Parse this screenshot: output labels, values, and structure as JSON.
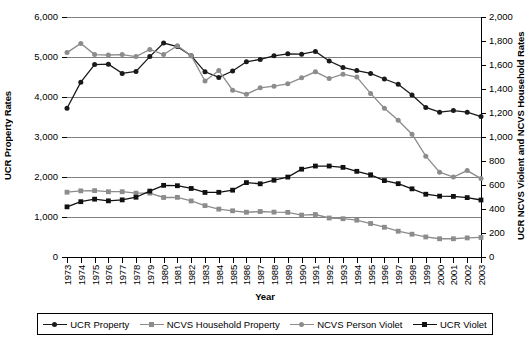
{
  "chart_data": {
    "type": "line",
    "title": "",
    "xlabel": "Year",
    "ylabel": "UCR Property Rates",
    "y2label": "UCR NCVS Violent and NCVS Household Rates",
    "grid": true,
    "legend_position": "bottom",
    "ylim": [
      0,
      6000
    ],
    "y2lim": [
      0,
      2000
    ],
    "yticks": [
      "0",
      "1,000",
      "2,000",
      "3,000",
      "4,000",
      "5,000",
      "6,000"
    ],
    "y2ticks": [
      "0",
      "200",
      "400",
      "600",
      "800",
      "1,000",
      "1,200",
      "1,400",
      "1,600",
      "1,800",
      "2,000"
    ],
    "categories": [
      "1973",
      "1974",
      "1975",
      "1976",
      "1977",
      "1978",
      "1979",
      "1980",
      "1981",
      "1982",
      "1983",
      "1984",
      "1985",
      "1986",
      "1987",
      "1988",
      "1989",
      "1990",
      "1991",
      "1992",
      "1993",
      "1994",
      "1995",
      "1996",
      "1997",
      "1998",
      "1999",
      "2000",
      "2001",
      "2002",
      "2003"
    ],
    "x": [
      1973,
      1974,
      1975,
      1976,
      1977,
      1978,
      1979,
      1980,
      1981,
      1982,
      1983,
      1984,
      1985,
      1986,
      1987,
      1988,
      1989,
      1990,
      1991,
      1992,
      1993,
      1994,
      1995,
      1996,
      1997,
      1998,
      1999,
      2000,
      2001,
      2002,
      2003
    ],
    "series": [
      {
        "name": "UCR Property",
        "axis": "left",
        "color": "#1a1a1a",
        "marker": "circle",
        "values": [
          3720,
          4370,
          4810,
          4820,
          4590,
          4640,
          5010,
          5350,
          5260,
          5030,
          4630,
          4490,
          4650,
          4880,
          4940,
          5030,
          5080,
          5070,
          5140,
          4900,
          4740,
          4660,
          4590,
          4450,
          4320,
          4050,
          3740,
          3620,
          3660,
          3620,
          3510
        ]
      },
      {
        "name": "NCVS Household Property",
        "axis": "right",
        "color": "#8c8c8c",
        "marker": "square",
        "values": [
          540,
          551,
          553,
          544,
          544,
          532,
          532,
          496,
          497,
          467,
          428,
          399,
          385,
          373,
          379,
          374,
          372,
          349,
          354,
          325,
          319,
          307,
          279,
          248,
          215,
          190,
          167,
          152,
          152,
          159,
          163
        ]
      },
      {
        "name": "NCVS Person Violet",
        "axis": "left",
        "color": "#8c8c8c",
        "marker": "circle",
        "values": [
          5110,
          5340,
          5060,
          5050,
          5060,
          5010,
          5190,
          5060,
          5280,
          5030,
          4400,
          4660,
          4170,
          4070,
          4230,
          4270,
          4330,
          4480,
          4630,
          4460,
          4570,
          4500,
          4090,
          3720,
          3420,
          3070,
          2520,
          2120,
          2000,
          2160,
          1960
        ]
      },
      {
        "name": "UCR Violet",
        "axis": "right",
        "color": "#111111",
        "marker": "square",
        "values": [
          418,
          461,
          482,
          468,
          476,
          498,
          549,
          597,
          594,
          571,
          538,
          539,
          557,
          620,
          610,
          640,
          666,
          732,
          758,
          758,
          747,
          714,
          685,
          637,
          611,
          568,
          523,
          507,
          505,
          495,
          475
        ]
      }
    ]
  }
}
